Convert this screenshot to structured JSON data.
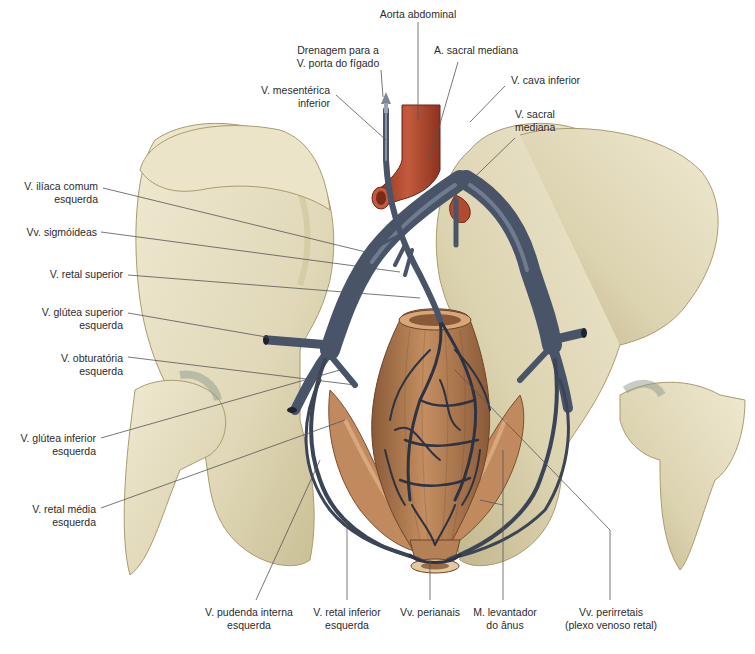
{
  "figure": {
    "colors": {
      "bone": "#e6dfc2",
      "bone_shadow": "#b9ad80",
      "vein": "#4a5468",
      "vein_light": "#7c879b",
      "artery": "#a8432a",
      "rectum": "#9c6a45",
      "rectum_light": "#c08a5e",
      "leader_line": "#555555"
    }
  },
  "labels": {
    "aorta": {
      "l1": "Aorta abdominal"
    },
    "drenagem": {
      "l1": "Drenagem para a",
      "l2": "V. porta do fígado"
    },
    "sacral_art": {
      "l1": "A. sacral mediana"
    },
    "cava": {
      "l1": "V. cava inferior"
    },
    "mesenterica": {
      "l1": "V. mesentérica",
      "l2": "inferior"
    },
    "sacral_vein": {
      "l1": "V. sacral",
      "l2": "mediana"
    },
    "iliaca": {
      "l1": "V. ilíaca comum",
      "l2": "esquerda"
    },
    "sigmoideas": {
      "l1": "Vv. sigmóideas"
    },
    "retal_sup": {
      "l1": "V. retal superior"
    },
    "glutea_sup": {
      "l1": "V. glútea superior",
      "l2": "esquerda"
    },
    "obturatoria": {
      "l1": "V. obturatória",
      "l2": "esquerda"
    },
    "glutea_inf": {
      "l1": "V. glútea inferior",
      "l2": "esquerda"
    },
    "retal_media": {
      "l1": "V. retal média",
      "l2": "esquerda"
    },
    "pudenda": {
      "l1": "V. pudenda interna",
      "l2": "esquerda"
    },
    "retal_inf": {
      "l1": "V. retal inferior",
      "l2": "esquerda"
    },
    "perianais": {
      "l1": "Vv. perianais"
    },
    "levantador": {
      "l1": "M. levantador",
      "l2": "do ânus"
    },
    "perirretais": {
      "l1": "Vv. perirretais",
      "l2": "(plexo venoso retal)"
    }
  }
}
